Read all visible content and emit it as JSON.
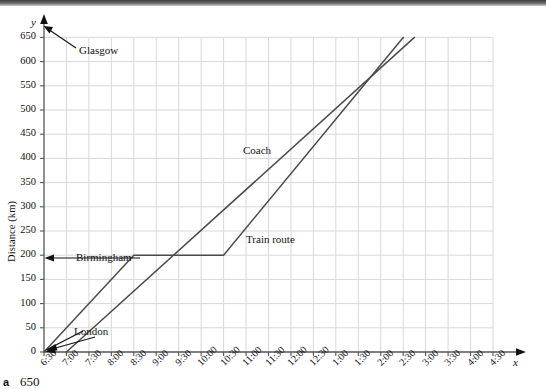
{
  "page": {
    "footer_marker": "a",
    "footer_value": "650"
  },
  "axes": {
    "x_name": "x",
    "y_name": "y",
    "y_title": "Distance (km)",
    "y_ticks": [
      0,
      50,
      100,
      150,
      200,
      250,
      300,
      350,
      400,
      450,
      500,
      550,
      600,
      650
    ],
    "x_ticks": [
      "6:30",
      "7:00",
      "7:30",
      "8:00",
      "8:30",
      "9:00",
      "9:30",
      "10:00",
      "10:30",
      "11:00",
      "11:30",
      "12:00",
      "12:30",
      "1:00",
      "1:30",
      "2:00",
      "2:30",
      "3:00",
      "3:30",
      "4:00",
      "4:30"
    ]
  },
  "annotations": {
    "glasgow": "Glasgow",
    "birmingham": "Birmingham",
    "london": "London",
    "coach": "Coach",
    "train": "Train route"
  },
  "colors": {
    "line": "#4a4a4a",
    "grid": "#d8d8d8",
    "axis": "#555555",
    "text": "#111111"
  },
  "chart_data": {
    "type": "line",
    "title": "",
    "xlabel": "x",
    "ylabel": "Distance (km)",
    "ylim": [
      0,
      650
    ],
    "xlim": [
      "6:30",
      "4:30"
    ],
    "grid": true,
    "legend": "inline-labels",
    "x_categories": [
      "6:30",
      "7:00",
      "7:30",
      "8:00",
      "8:30",
      "9:00",
      "9:30",
      "10:00",
      "10:30",
      "11:00",
      "11:30",
      "12:00",
      "12:30",
      "1:00",
      "1:30",
      "2:00",
      "2:30",
      "3:00",
      "3:30",
      "4:00",
      "4:30"
    ],
    "series": [
      {
        "name": "Train route",
        "points": [
          {
            "time": "6:30",
            "distance": 0
          },
          {
            "time": "8:30",
            "distance": 200
          },
          {
            "time": "10:30",
            "distance": 200
          },
          {
            "time": "2:30",
            "distance": 650
          }
        ]
      },
      {
        "name": "Coach",
        "points": [
          {
            "time": "7:00",
            "distance": 0
          },
          {
            "time": "2:45",
            "distance": 650
          }
        ]
      }
    ],
    "markers": [
      {
        "label": "London",
        "distance": 0
      },
      {
        "label": "Birmingham",
        "distance": 200
      },
      {
        "label": "Glasgow",
        "distance": 650
      }
    ]
  }
}
